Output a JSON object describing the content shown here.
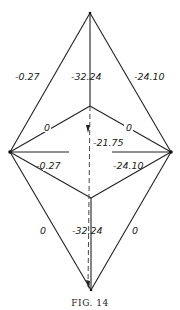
{
  "figure": {
    "caption": "Fig. 14",
    "caption_display": "FIG. 14"
  },
  "nodes": {
    "top": [
      90,
      13
    ],
    "upper_junction": [
      90,
      106
    ],
    "left": [
      10,
      152
    ],
    "right": [
      171,
      152
    ],
    "lower_junction": [
      91,
      198
    ],
    "bottom": [
      91,
      290
    ]
  },
  "labels": {
    "upper_left_edge": "-0.27",
    "upper_center_edge": "-32.24",
    "upper_right_edge": "-24.10",
    "upper_left_spoke": "0",
    "upper_right_spoke": "0",
    "center_dashed": "-21.75",
    "lower_left_spoke": "-0.27",
    "lower_right_spoke": "-24.10",
    "lower_left_edge": "0",
    "lower_center_edge": "-32.24",
    "lower_right_edge": "0"
  }
}
